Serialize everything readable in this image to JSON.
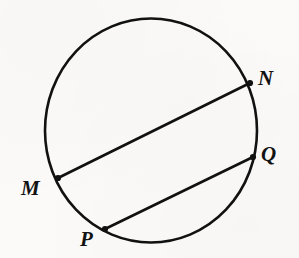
{
  "figure": {
    "type": "geometry-diagram",
    "background_color": "#fbfaf8",
    "stroke_color": "#111111",
    "label_color": "#121212",
    "canvas": {
      "width": 299,
      "height": 258
    },
    "circle": {
      "name": "circle",
      "center_x": 151,
      "center_y": 130.5,
      "radius_x": 106,
      "radius_y": 112,
      "stroke_width": 2.6
    },
    "points": [
      {
        "id": "M",
        "label": "M",
        "x": 58,
        "y": 178,
        "dot_radius": 3.1,
        "label_x": 21,
        "label_y": 178,
        "label_anchor": "left"
      },
      {
        "id": "N",
        "label": "N",
        "x": 250,
        "y": 83,
        "dot_radius": 3.1,
        "label_x": 258,
        "label_y": 68,
        "label_anchor": "right"
      },
      {
        "id": "P",
        "label": "P",
        "x": 105,
        "y": 229,
        "dot_radius": 3.1,
        "label_x": 80,
        "label_y": 229,
        "label_anchor": "below-left"
      },
      {
        "id": "Q",
        "label": "Q",
        "x": 253,
        "y": 157,
        "dot_radius": 3.1,
        "label_x": 261,
        "label_y": 144,
        "label_anchor": "right"
      }
    ],
    "chords": [
      {
        "id": "MN",
        "name": "chord-mn",
        "from": "M",
        "from_x": 58,
        "from_y": 178,
        "to": "N",
        "to_x": 250,
        "to_y": 83,
        "stroke_width": 2.6
      },
      {
        "id": "PQ",
        "name": "chord-pq",
        "from": "P",
        "from_x": 105,
        "from_y": 229,
        "to": "Q",
        "to_x": 253,
        "to_y": 157,
        "stroke_width": 2.6
      }
    ]
  }
}
